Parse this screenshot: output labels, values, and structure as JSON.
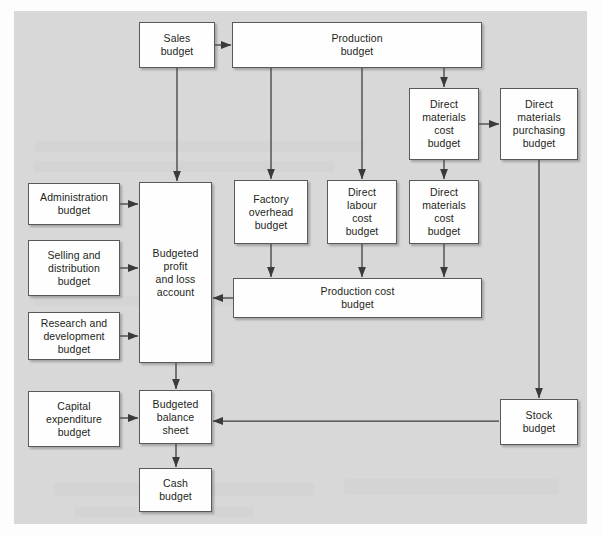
{
  "figure": {
    "type": "flowchart",
    "panel_color": "#d8d8d8",
    "box_fill": "#fefefe",
    "box_border": "#58595b",
    "arrow_color": "#3a3a3a"
  },
  "nodes": [
    {
      "id": "sales",
      "label": "Sales\nbudget",
      "x": 139,
      "y": 22,
      "w": 76,
      "h": 46
    },
    {
      "id": "production",
      "label": "Production\nbudget",
      "x": 232,
      "y": 22,
      "w": 250,
      "h": 46
    },
    {
      "id": "dm_cost_top",
      "label": "Direct\nmaterials\ncost\nbudget",
      "x": 409,
      "y": 88,
      "w": 70,
      "h": 72
    },
    {
      "id": "dm_purchasing",
      "label": "Direct\nmaterials\npurchasing\nbudget",
      "x": 500,
      "y": 88,
      "w": 78,
      "h": 72
    },
    {
      "id": "administration",
      "label": "Administration\nbudget",
      "x": 28,
      "y": 183,
      "w": 92,
      "h": 42
    },
    {
      "id": "selling",
      "label": "Selling and\ndistribution\nbudget",
      "x": 28,
      "y": 240,
      "w": 92,
      "h": 56
    },
    {
      "id": "research",
      "label": "Research and\ndevelopment\nbudget",
      "x": 28,
      "y": 312,
      "w": 92,
      "h": 48
    },
    {
      "id": "profit_loss",
      "label": "Budgeted\nprofit\nand loss\naccount",
      "x": 139,
      "y": 182,
      "w": 73,
      "h": 181
    },
    {
      "id": "factory_overhead",
      "label": "Factory\noverhead\nbudget",
      "x": 234,
      "y": 180,
      "w": 74,
      "h": 64
    },
    {
      "id": "dl_cost",
      "label": "Direct\nlabour\ncost\nbudget",
      "x": 327,
      "y": 180,
      "w": 70,
      "h": 64
    },
    {
      "id": "dm_cost_mid",
      "label": "Direct\nmaterials\ncost\nbudget",
      "x": 409,
      "y": 180,
      "w": 70,
      "h": 64
    },
    {
      "id": "production_cost",
      "label": "Production cost\nbudget",
      "x": 233,
      "y": 278,
      "w": 249,
      "h": 40
    },
    {
      "id": "capital",
      "label": "Capital\nexpenditure\nbudget",
      "x": 28,
      "y": 391,
      "w": 92,
      "h": 56
    },
    {
      "id": "balance_sheet",
      "label": "Budgeted\nbalance\nsheet",
      "x": 139,
      "y": 390,
      "w": 73,
      "h": 54
    },
    {
      "id": "cash",
      "label": "Cash\nbudget",
      "x": 139,
      "y": 468,
      "w": 73,
      "h": 44
    },
    {
      "id": "stock",
      "label": "Stock\nbudget",
      "x": 500,
      "y": 399,
      "w": 78,
      "h": 46
    }
  ],
  "edges": [
    {
      "id": "sales-to-production",
      "from": "sales",
      "to": "production",
      "kind": "horizontal"
    },
    {
      "id": "sales-to-profit-loss",
      "from": "sales",
      "to": "profit_loss",
      "kind": "vertical"
    },
    {
      "id": "production-to-dm-cost-top",
      "from": "production",
      "to": "dm_cost_top",
      "kind": "vertical"
    },
    {
      "id": "production-to-factory",
      "from": "production",
      "to": "factory_overhead",
      "kind": "vertical"
    },
    {
      "id": "production-to-dl-cost",
      "from": "production",
      "to": "dl_cost",
      "kind": "vertical"
    },
    {
      "id": "dm-cost-top-to-purchasing",
      "from": "dm_cost_top",
      "to": "dm_purchasing",
      "kind": "horizontal"
    },
    {
      "id": "dm-cost-top-to-dm-cost-mid",
      "from": "dm_cost_top",
      "to": "dm_cost_mid",
      "kind": "vertical"
    },
    {
      "id": "purchasing-to-stock",
      "from": "dm_purchasing",
      "to": "stock",
      "kind": "vertical"
    },
    {
      "id": "administration-to-profit",
      "from": "administration",
      "to": "profit_loss",
      "kind": "horizontal"
    },
    {
      "id": "selling-to-profit",
      "from": "selling",
      "to": "profit_loss",
      "kind": "horizontal"
    },
    {
      "id": "research-to-profit",
      "from": "research",
      "to": "profit_loss",
      "kind": "horizontal"
    },
    {
      "id": "factory-to-production-cost",
      "from": "factory_overhead",
      "to": "production_cost",
      "kind": "vertical"
    },
    {
      "id": "dl-to-production-cost",
      "from": "dl_cost",
      "to": "production_cost",
      "kind": "vertical"
    },
    {
      "id": "dm-mid-to-production-cost",
      "from": "dm_cost_mid",
      "to": "production_cost",
      "kind": "vertical"
    },
    {
      "id": "production-cost-to-profit",
      "from": "production_cost",
      "to": "profit_loss",
      "kind": "elbow"
    },
    {
      "id": "profit-to-balance-sheet",
      "from": "profit_loss",
      "to": "balance_sheet",
      "kind": "vertical"
    },
    {
      "id": "capital-to-balance-sheet",
      "from": "capital",
      "to": "balance_sheet",
      "kind": "horizontal"
    },
    {
      "id": "balance-sheet-to-cash",
      "from": "balance_sheet",
      "to": "cash",
      "kind": "vertical"
    },
    {
      "id": "stock-to-balance-sheet",
      "from": "stock",
      "to": "balance_sheet",
      "kind": "horizontal"
    }
  ]
}
